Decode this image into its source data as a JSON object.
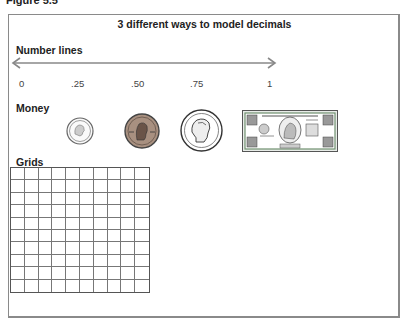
{
  "figure_label": "Figure 5.5",
  "title": "3 different ways to model decimals",
  "sections": {
    "number_lines": {
      "label": "Number lines",
      "ticks": [
        "0",
        ".25",
        ".50",
        ".75",
        "1"
      ]
    },
    "money": {
      "label": "Money",
      "items": [
        {
          "name": "dime",
          "value": ".10"
        },
        {
          "name": "penny",
          "value": ".01"
        },
        {
          "name": "nickel",
          "value": ".05"
        },
        {
          "name": "dollar-bill",
          "value": "1.00",
          "text": "THE UNITED STATES OF AMERICA",
          "denomination": "ONE DOLLAR"
        }
      ]
    },
    "grids": {
      "label": "Grids",
      "rows": 10,
      "cols": 10
    }
  },
  "colors": {
    "border": "#8a8a8a",
    "arrow": "#888888",
    "penny": "#9a7b5a",
    "bill": "#6f8f6f"
  }
}
